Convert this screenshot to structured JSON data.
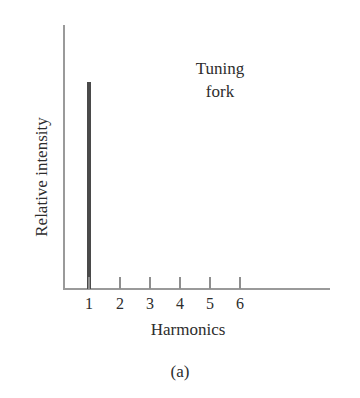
{
  "figure": {
    "panel_caption": "(a)",
    "background_color": "#ffffff",
    "axis_color": "#9a9a9a",
    "bar_color": "#4a4a4a",
    "text_color": "#2d2d2d"
  },
  "chart_data": {
    "type": "bar",
    "title": "Tuning fork",
    "title_lines": [
      "Tuning",
      "fork"
    ],
    "xlabel": "Harmonics",
    "ylabel": "Relative intensity",
    "categories": [
      "1",
      "2",
      "3",
      "4",
      "5",
      "6"
    ],
    "values": [
      1.0,
      0,
      0,
      0,
      0,
      0
    ],
    "ylim": [
      0,
      1.1
    ],
    "grid": false,
    "legend": "none",
    "annotations": [
      "Tuning fork",
      "(a)"
    ]
  }
}
